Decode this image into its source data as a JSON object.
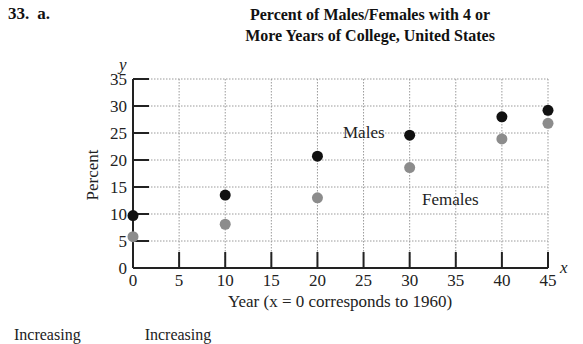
{
  "problem": {
    "number": "33.",
    "part": "a."
  },
  "title_line1": "Percent of Males/Females with 4 or",
  "title_line2": "More Years of College, United States",
  "axes": {
    "y_var": "y",
    "x_var": "x",
    "ylabel": "Percent",
    "xlabel": "Year (x = 0 corresponds to 1960)"
  },
  "labels": {
    "males": "Males",
    "females": "Females"
  },
  "colors": {
    "males": "#111111",
    "females": "#8c8c8c",
    "grid": "#9a9a9a"
  },
  "bottom_cut_text": [
    "Increasing",
    "Increasing"
  ],
  "chart_data": {
    "type": "scatter",
    "title": "Percent of Males/Females with 4 or More Years of College, United States",
    "xlabel": "Year (x = 0 corresponds to 1960)",
    "ylabel": "Percent",
    "xlim": [
      0,
      45
    ],
    "ylim": [
      0,
      35
    ],
    "x_ticks": [
      0,
      5,
      10,
      15,
      20,
      25,
      30,
      35,
      40,
      45
    ],
    "y_ticks": [
      0,
      5,
      10,
      15,
      20,
      25,
      30,
      35
    ],
    "grid": true,
    "legend": "inline labels (Males near x=30, Females near x=35)",
    "x": [
      0,
      10,
      20,
      30,
      40,
      45
    ],
    "series": [
      {
        "name": "Males",
        "color": "#111111",
        "values": [
          9.7,
          13.5,
          20.7,
          24.6,
          28.0,
          29.2
        ]
      },
      {
        "name": "Females",
        "color": "#8c8c8c",
        "values": [
          5.8,
          8.1,
          13.0,
          18.6,
          23.9,
          26.8
        ]
      }
    ]
  }
}
